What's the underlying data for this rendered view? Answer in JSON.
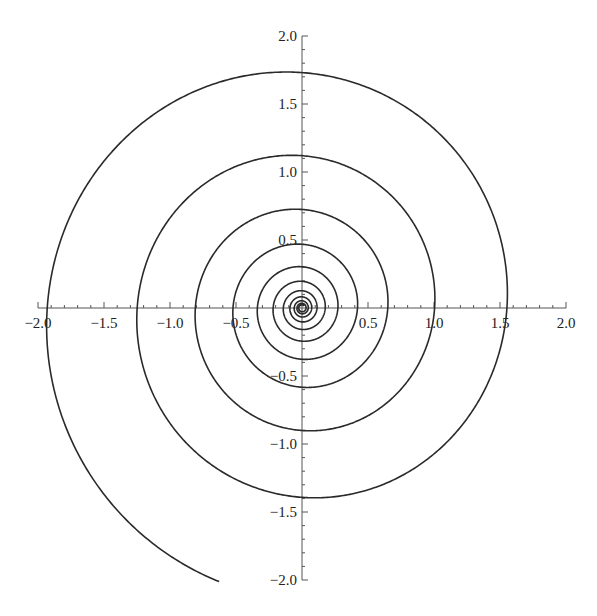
{
  "chart_data": {
    "type": "line",
    "title": "",
    "subtitle": "",
    "xlabel": "",
    "ylabel": "",
    "xlim": [
      -2.0,
      2.0
    ],
    "ylim": [
      -2.0,
      2.0
    ],
    "grid": false,
    "legend": null,
    "x_ticks": [
      "−2.0",
      "−1.5",
      "−1.0",
      "−0.5",
      "0.5",
      "1.0",
      "1.5",
      "2.0"
    ],
    "x_tick_values": [
      -2.0,
      -1.5,
      -1.0,
      -0.5,
      0.5,
      1.0,
      1.5,
      2.0
    ],
    "y_ticks": [
      "2.0",
      "1.5",
      "1.0",
      "0.5",
      "−0.5",
      "−1.0",
      "−1.5",
      "−2.0"
    ],
    "y_tick_values": [
      2.0,
      1.5,
      1.0,
      0.5,
      -0.5,
      -1.0,
      -1.5,
      -2.0
    ],
    "minor_tick_step": 0.1,
    "series": [
      {
        "name": "spiral",
        "equation": "r = a*exp(b*(theta - pi))",
        "a": 1.93,
        "b": 0.0693,
        "theta_start": 4.41,
        "theta_end": -62,
        "axis_crossings": {
          "negative_x": [
            -1.93,
            -1.24,
            -0.8,
            -0.49,
            -0.32,
            -0.2
          ],
          "positive_y": [
            1.74,
            1.12,
            0.71,
            0.45
          ],
          "positive_x": [
            1.55,
            0.97,
            0.65,
            0.42,
            0.28
          ],
          "negative_y": [
            -1.38,
            -0.88,
            -0.56,
            -0.36
          ]
        },
        "outer_end_point": [
          -0.62,
          -2.01
        ]
      }
    ]
  },
  "style": {
    "curve_color": "#2a2a2a",
    "axis_color": "#555555",
    "label_color": "#222222"
  },
  "layout": {
    "origin_px": [
      302,
      308
    ],
    "x_scale_px": 132,
    "y_scale_px": 136
  }
}
